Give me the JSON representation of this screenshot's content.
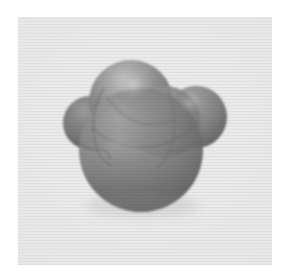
{
  "figure": {
    "kind": "3d-molecular-surface-render",
    "caption": "",
    "canvas": {
      "width": 287,
      "height": 279
    },
    "background_color": "#ffffff",
    "plate": {
      "color": "#e9e9e9",
      "x": 18,
      "y": 17,
      "width": 254,
      "height": 248
    },
    "render": {
      "style": "cpk-space-filling",
      "shading": "smooth-gouraud-grayscale",
      "transparency": "semi-transparent overlapping spheres",
      "light_direction": "upper-left",
      "palette": {
        "highlight": "#c2c2c2",
        "midtone": "#8c8c8c",
        "base": "#7c7c7c",
        "shadow": "#5e5e5e",
        "deep_shadow": "#4e4e4e",
        "outline": "#6a6a6a"
      }
    },
    "atoms": [
      {
        "label": "central-sphere",
        "role": "core atom",
        "cx": 141,
        "cy": 150,
        "r": 62,
        "depth": "front-lower",
        "tone": "#808080"
      },
      {
        "label": "top-sphere",
        "role": "substituent atom",
        "cx": 131,
        "cy": 102,
        "r": 42,
        "depth": "back-upper",
        "tone": "#8a8a8a"
      },
      {
        "label": "left-sphere",
        "role": "substituent atom",
        "cx": 90,
        "cy": 123,
        "r": 27,
        "depth": "left",
        "tone": "#777777"
      },
      {
        "label": "right-sphere",
        "role": "substituent atom",
        "cx": 196,
        "cy": 117,
        "r": 31,
        "depth": "right",
        "tone": "#7e7e7e"
      },
      {
        "label": "inner-sphere",
        "role": "interior atom (seen through surface)",
        "cx": 165,
        "cy": 122,
        "r": 36,
        "depth": "interior",
        "tone": "#848484"
      }
    ],
    "specular_highlights": [
      {
        "label": "top-sphere-highlight",
        "cx": 133,
        "cy": 84,
        "rx": 17,
        "ry": 13,
        "intensity": "#c4c4c4"
      },
      {
        "label": "right-sphere-highlight",
        "cx": 190,
        "cy": 103,
        "rx": 11,
        "ry": 9,
        "intensity": "#a8a8a8"
      },
      {
        "label": "central-sphere-sheen",
        "cx": 120,
        "cy": 140,
        "rx": 30,
        "ry": 24,
        "intensity": "#969696"
      }
    ],
    "bounds": {
      "left": 66,
      "right": 223,
      "top": 62,
      "bottom": 211
    }
  }
}
